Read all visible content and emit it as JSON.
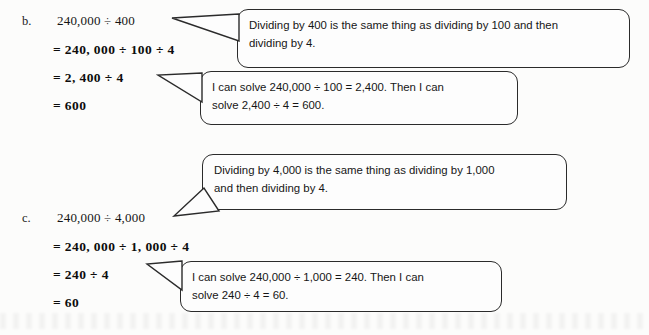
{
  "page": {
    "type": "math-worked-examples",
    "background_color": "#fcfcfb",
    "ink_color": "#1a1a1a"
  },
  "problems": [
    {
      "label": "b.",
      "expression": "240,000 ÷ 400",
      "steps": [
        "= 240, 000 ÷ 100 ÷ 4",
        "= 2, 400 ÷ 4",
        "= 600"
      ]
    },
    {
      "label": "c.",
      "expression": "240,000 ÷ 4,000",
      "steps": [
        "= 240, 000 ÷ 1, 000 ÷ 4",
        "= 240 ÷ 4",
        "= 60"
      ]
    }
  ],
  "callouts": [
    {
      "id": "callout-b-concept",
      "line1": "Dividing by 400 is the same thing as dividing by 100 and then",
      "line2": "dividing by 4.",
      "points_to": "240,000 ÷ 400"
    },
    {
      "id": "callout-b-compute",
      "line1": "I can solve 240,000 ÷ 100 = 2,400.  Then I can",
      "line2": "solve 2,400 ÷ 4 = 600.",
      "points_to": "= 2, 400 ÷ 4"
    },
    {
      "id": "callout-c-concept",
      "line1": "Dividing by 4,000 is the same thing as dividing by 1,000",
      "line2": "and then dividing by 4.",
      "points_to": "240,000 ÷ 4,000"
    },
    {
      "id": "callout-c-compute",
      "line1": "I can solve 240,000 ÷ 1,000 = 240.  Then I can",
      "line2": "solve 240 ÷ 4 = 60.",
      "points_to": "= 240 ÷ 4"
    }
  ]
}
